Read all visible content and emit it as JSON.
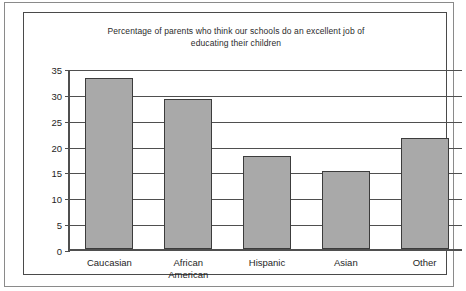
{
  "chart_data": {
    "type": "bar",
    "title": "Percentage of parents who think our schools do an excellent job of educating their children",
    "title_line1": "Percentage of parents who think our schools do an excellent job of",
    "title_line2": "educating their children",
    "categories": [
      "Caucasian",
      "African\nAmerican",
      "Hispanic",
      "Asian",
      "Other"
    ],
    "values": [
      33,
      29,
      18,
      15,
      21.5
    ],
    "xlabel": "",
    "ylabel": "",
    "ylim": [
      0,
      35
    ],
    "yticks": [
      0,
      5,
      10,
      15,
      20,
      25,
      30,
      35
    ],
    "ytick_labels": [
      "0",
      "5",
      "10",
      "15",
      "20",
      "25",
      "30",
      "35"
    ],
    "grid": true,
    "legend": false,
    "bar_color": "#a9a9a9",
    "bar_border_color": "#3c3c3c",
    "axis_color": "#4f4f4f",
    "background_color": "#ffffff"
  }
}
